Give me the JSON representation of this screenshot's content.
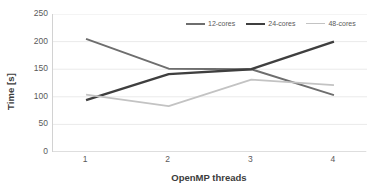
{
  "chart_data": {
    "type": "line",
    "title": "",
    "xlabel": "OpenMP threads",
    "ylabel": "Time [s]",
    "categories": [
      "1",
      "2",
      "3",
      "4"
    ],
    "x": [
      1,
      2,
      3,
      4
    ],
    "xlim": [
      0.6,
      4.4
    ],
    "ylim": [
      0,
      250
    ],
    "yticks": [
      "0",
      "50",
      "100",
      "150",
      "200",
      "250"
    ],
    "ytick_values": [
      0,
      50,
      100,
      150,
      200,
      250
    ],
    "xticks": [
      "1",
      "2",
      "3",
      "4"
    ],
    "grid": "horizontal",
    "legend_position": "top-right",
    "series": [
      {
        "name": "12-cores",
        "color": "#6e6e6e",
        "width": 2.0,
        "values": [
          205,
          151,
          150,
          103
        ]
      },
      {
        "name": "24-cores",
        "color": "#3f3f3f",
        "width": 2.4,
        "values": [
          94,
          141,
          150,
          200
        ]
      },
      {
        "name": "48-cores",
        "color": "#c3c3c3",
        "width": 1.8,
        "values": [
          104,
          83,
          131,
          121
        ]
      }
    ]
  },
  "legend": {
    "items": [
      {
        "label": "12-cores"
      },
      {
        "label": "24-cores"
      },
      {
        "label": "48-cores"
      }
    ]
  },
  "axes": {
    "y_title": "Time [s]",
    "x_title": "OpenMP threads"
  },
  "colors": {
    "background": "#ffffff",
    "gridline": "#eaeaea",
    "axis_line": "#d2d2d2",
    "tick_text": "#5a5a5a",
    "title_text": "#3c3c3c"
  }
}
